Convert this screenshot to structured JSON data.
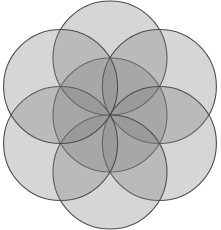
{
  "figure": {
    "name": "flower-of-life-rosette",
    "background_color": "#ffffff",
    "canvas": {
      "width": 221,
      "height": 230
    }
  },
  "style": {
    "fill_color": "#808080",
    "fill_opacity": 0.32,
    "stroke_color": "#4d4d4d",
    "stroke_width": 1.1,
    "single_overlap_color": "#d9d9d9",
    "double_overlap_color": "#bfbfbf",
    "petal_color": "#9a9a9a"
  },
  "geometry": {
    "center": {
      "cx": 110,
      "cy": 115
    },
    "radius": 57,
    "ring_distance": 57,
    "circle_count": 7,
    "petal_count": 6,
    "angle_step_degrees": 60,
    "start_angle_degrees": -90,
    "circles": [
      {
        "id": "circle-center",
        "label": "center",
        "cx": 110.0,
        "cy": 115.0
      },
      {
        "id": "circle-top",
        "label": "top",
        "cx": 110.0,
        "cy": 58.0
      },
      {
        "id": "circle-upper-right",
        "label": "upper-right",
        "cx": 159.4,
        "cy": 86.5
      },
      {
        "id": "circle-lower-right",
        "label": "lower-right",
        "cx": 159.4,
        "cy": 143.5
      },
      {
        "id": "circle-bottom",
        "label": "bottom",
        "cx": 110.0,
        "cy": 172.0
      },
      {
        "id": "circle-lower-left",
        "label": "lower-left",
        "cx": 60.6,
        "cy": 143.5
      },
      {
        "id": "circle-upper-left",
        "label": "upper-left",
        "cx": 60.6,
        "cy": 86.5
      }
    ]
  },
  "bounds": {
    "left": 10,
    "top": 14,
    "right": 210,
    "bottom": 217
  }
}
